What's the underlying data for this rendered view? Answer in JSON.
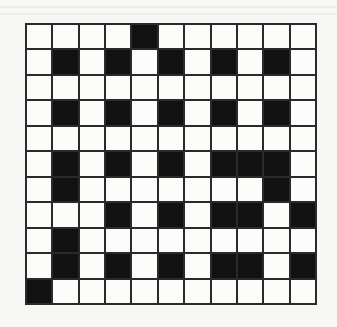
{
  "puzzle": {
    "type": "crossword-grid",
    "rows": 11,
    "cols": 11,
    "colors": {
      "block": "#111111",
      "empty": "#fbfbfa",
      "line": "#2a2a2a"
    },
    "black_cells": [
      [
        4
      ],
      [
        1,
        3,
        5,
        7,
        9
      ],
      [],
      [
        1,
        3,
        5,
        7,
        9
      ],
      [],
      [
        1,
        3,
        5,
        7,
        8,
        9
      ],
      [
        1,
        9
      ],
      [
        3,
        5,
        7,
        8,
        10
      ],
      [
        1
      ],
      [
        1,
        3,
        5,
        7,
        8,
        10
      ],
      [
        0
      ]
    ]
  }
}
